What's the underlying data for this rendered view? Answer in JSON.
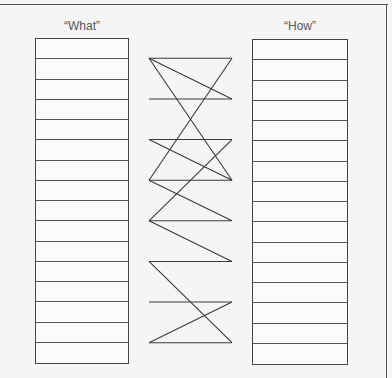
{
  "diagram": {
    "left_label": "“What”",
    "right_label": "“How”",
    "row_count": 16,
    "line_color": "#3a3a3a",
    "left_rows": [
      "",
      "",
      "",
      "",
      "",
      "",
      "",
      "",
      "",
      "",
      "",
      "",
      "",
      "",
      "",
      ""
    ],
    "right_rows": [
      "",
      "",
      "",
      "",
      "",
      "",
      "",
      "",
      "",
      "",
      "",
      "",
      "",
      "",
      "",
      ""
    ],
    "connections": [
      {
        "from_left_row": 1,
        "to_right_row": 1
      },
      {
        "from_left_row": 1,
        "to_right_row": 3
      },
      {
        "from_left_row": 1,
        "to_right_row": 7
      },
      {
        "from_left_row": 7,
        "to_right_row": 1
      },
      {
        "from_left_row": 3,
        "to_right_row": 3
      },
      {
        "from_left_row": 5,
        "to_right_row": 5
      },
      {
        "from_left_row": 5,
        "to_right_row": 7
      },
      {
        "from_left_row": 9,
        "to_right_row": 5
      },
      {
        "from_left_row": 7,
        "to_right_row": 7
      },
      {
        "from_left_row": 7,
        "to_right_row": 9
      },
      {
        "from_left_row": 9,
        "to_right_row": 9
      },
      {
        "from_left_row": 9,
        "to_right_row": 11
      },
      {
        "from_left_row": 11,
        "to_right_row": 11
      },
      {
        "from_left_row": 11,
        "to_right_row": 15
      },
      {
        "from_left_row": 13,
        "to_right_row": 13
      },
      {
        "from_left_row": 15,
        "to_right_row": 13
      },
      {
        "from_left_row": 15,
        "to_right_row": 15
      }
    ]
  }
}
